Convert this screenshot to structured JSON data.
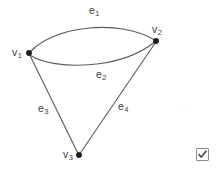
{
  "figure": {
    "type": "undirected-multigraph",
    "background_color": "#ffffff",
    "edge_color": "#5a5a5a",
    "vertex_color": "#1b1b1b",
    "label_color": "#3c3c3c",
    "vertices": [
      {
        "id": "v1",
        "label_base": "v",
        "label_sub": "1",
        "x": 29,
        "y": 53
      },
      {
        "id": "v2",
        "label_base": "v",
        "label_sub": "2",
        "x": 156,
        "y": 41
      },
      {
        "id": "v3",
        "label_base": "v",
        "label_sub": "3",
        "x": 79,
        "y": 155
      }
    ],
    "edges": [
      {
        "id": "e1",
        "label_base": "e",
        "label_sub": "1",
        "from": "v1",
        "to": "v2",
        "shape": "curve-up"
      },
      {
        "id": "e2",
        "label_base": "e",
        "label_sub": "2",
        "from": "v1",
        "to": "v2",
        "shape": "curve-down"
      },
      {
        "id": "e3",
        "label_base": "e",
        "label_sub": "3",
        "from": "v1",
        "to": "v3",
        "shape": "straight"
      },
      {
        "id": "e4",
        "label_base": "e",
        "label_sub": "4",
        "from": "v3",
        "to": "v2",
        "shape": "straight"
      }
    ]
  },
  "widgets": {
    "checkbox": {
      "name": "checkbox-checked",
      "checked": true,
      "border_color": "#8c8c8c",
      "fill_color": "#fdfdfd",
      "check_color": "#4a4a4a"
    }
  }
}
